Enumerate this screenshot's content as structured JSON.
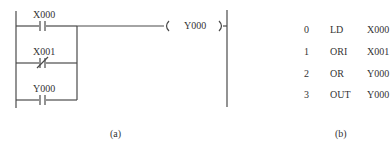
{
  "ladder_diagram": {
    "caption": "(a)",
    "rungs": [
      {
        "contact": "X000",
        "type": "normally-open"
      },
      {
        "contact": "X001",
        "type": "normally-closed"
      },
      {
        "contact": "Y000",
        "type": "normally-open"
      }
    ],
    "coil": {
      "label": "Y000"
    },
    "colors": {
      "line": "#4a4a4a"
    }
  },
  "instruction_list": {
    "caption": "(b)",
    "rows": [
      {
        "step": "0",
        "op": "LD",
        "operand": "X000"
      },
      {
        "step": "1",
        "op": "ORI",
        "operand": "X001"
      },
      {
        "step": "2",
        "op": "OR",
        "operand": "Y000"
      },
      {
        "step": "3",
        "op": "OUT",
        "operand": "Y000"
      }
    ]
  }
}
